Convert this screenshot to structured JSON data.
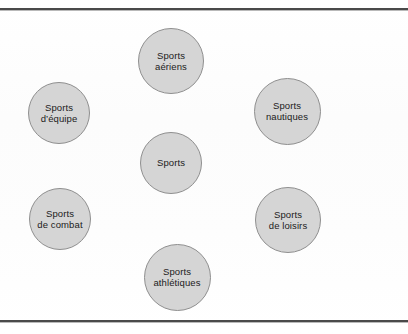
{
  "figure": {
    "background_color": "#fdfdfd",
    "rule_color": "#4a4a4a",
    "node_fill_color": "#d5d5d5",
    "node_stroke_color": "#8f8f8f",
    "label_color": "#1b1b1b"
  },
  "diagram": {
    "type": "concept-map",
    "center": {
      "label": "Sports",
      "x": 171,
      "y": 163,
      "diameter": 62
    },
    "nodes": [
      {
        "id": "sports-aeriens",
        "label": "Sports\naériens",
        "x": 171,
        "y": 61,
        "diameter": 66,
        "position": "top"
      },
      {
        "id": "sports-d-equipe",
        "label": "Sports\nd’équipe",
        "x": 59,
        "y": 113,
        "diameter": 62,
        "position": "left-upper"
      },
      {
        "id": "sports-nautiques",
        "label": "Sports\nnautiques",
        "x": 287,
        "y": 111,
        "diameter": 67,
        "position": "right-upper"
      },
      {
        "id": "sports-de-combat",
        "label": "Sports\nde combat",
        "x": 60,
        "y": 219,
        "diameter": 62,
        "position": "left-lower"
      },
      {
        "id": "sports-de-loisirs",
        "label": "Sports\nde loisirs",
        "x": 288,
        "y": 220,
        "diameter": 66,
        "position": "right-lower"
      },
      {
        "id": "sports-athletiques",
        "label": "Sports\nathlétiques",
        "x": 177,
        "y": 277,
        "diameter": 67,
        "position": "bottom"
      }
    ]
  }
}
